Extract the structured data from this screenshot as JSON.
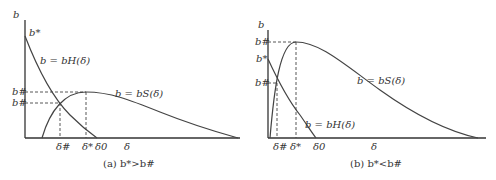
{
  "panels": [
    {
      "id": "a",
      "caption": "(a) b*>b#",
      "y_axis_label": "b",
      "x_axis_label": "δ",
      "y_ticks": [
        "b*",
        "b#",
        "b^#"
      ],
      "x_ticks": [
        "δ^#",
        "δ*",
        "δ0"
      ],
      "curves": [
        {
          "name": "b_H",
          "label": "b = bH(δ)"
        },
        {
          "name": "b_S",
          "label": "b = bS(δ)"
        }
      ]
    },
    {
      "id": "b",
      "caption": "(b) b*<b#",
      "y_axis_label": "b",
      "x_axis_label": "δ",
      "y_ticks": [
        "b#",
        "b*",
        "b^#"
      ],
      "x_ticks": [
        "δ^#",
        "δ*",
        "δ0"
      ],
      "curves": [
        {
          "name": "b_S",
          "label": "b = bS(δ)"
        },
        {
          "name": "b_H",
          "label": "b = bH(δ)"
        }
      ]
    }
  ],
  "text": {
    "a_caption": "(a) b*>b#",
    "b_caption": "(b) b*<b#",
    "b": "b",
    "delta": "δ",
    "bstar": "b*",
    "bhash": "b#",
    "bsup": "b#",
    "dsup": "δ#",
    "dstar": "δ*",
    "d0": "δ0",
    "bH": "b = bH(δ)",
    "bS": "b = bS(δ)"
  }
}
